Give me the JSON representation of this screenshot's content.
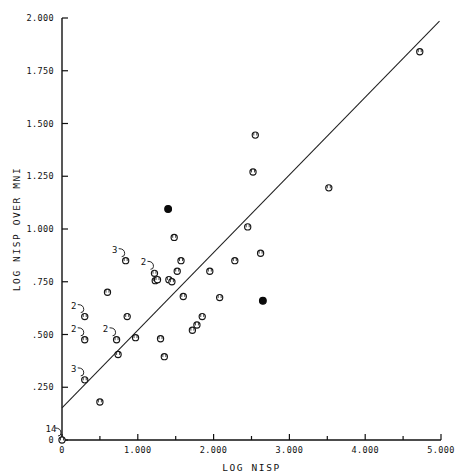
{
  "chart_data": {
    "type": "scatter",
    "title": "",
    "xlabel": "LOG NISP",
    "ylabel": "LOG NISP OVER MNI",
    "xlim": [
      0,
      5.0
    ],
    "ylim": [
      0,
      2.0
    ],
    "grid": false,
    "legend": null,
    "x_ticks": [
      0,
      0.5,
      1.0,
      1.5,
      2.0,
      2.5,
      3.0,
      3.5,
      4.0,
      4.5,
      5.0
    ],
    "x_tick_labels": [
      "0",
      "",
      "1.000",
      "",
      "2.000",
      "",
      "3.000",
      "",
      "4.000",
      "",
      "5.000"
    ],
    "y_ticks": [
      0,
      0.25,
      0.5,
      0.75,
      1.0,
      1.25,
      1.5,
      1.75,
      2.0
    ],
    "y_tick_labels": [
      "0",
      ".250",
      ".500",
      ".750",
      "1.000",
      "1.250",
      "1.500",
      "1.750",
      "2.000"
    ],
    "marker_styles": {
      "open": "open-circle",
      "filled": "filled-circle"
    },
    "points": [
      {
        "x": 0.0,
        "y": 0.0,
        "marker": "open",
        "count": 14,
        "label": "14"
      },
      {
        "x": 0.3,
        "y": 0.285,
        "marker": "open",
        "count": 3,
        "label": "3"
      },
      {
        "x": 0.3,
        "y": 0.475,
        "marker": "open",
        "count": 2,
        "label": "2"
      },
      {
        "x": 0.3,
        "y": 0.585,
        "marker": "open",
        "count": 2,
        "label": "2"
      },
      {
        "x": 0.5,
        "y": 0.18,
        "marker": "open",
        "count": 1,
        "label": ""
      },
      {
        "x": 0.6,
        "y": 0.7,
        "marker": "open",
        "count": 1,
        "label": ""
      },
      {
        "x": 0.72,
        "y": 0.475,
        "marker": "open",
        "count": 2,
        "label": "2"
      },
      {
        "x": 0.74,
        "y": 0.405,
        "marker": "open",
        "count": 1,
        "label": ""
      },
      {
        "x": 0.84,
        "y": 0.85,
        "marker": "open",
        "count": 3,
        "label": "3"
      },
      {
        "x": 0.86,
        "y": 0.585,
        "marker": "open",
        "count": 1,
        "label": ""
      },
      {
        "x": 0.97,
        "y": 0.485,
        "marker": "open",
        "count": 1,
        "label": ""
      },
      {
        "x": 1.22,
        "y": 0.79,
        "marker": "open",
        "count": 2,
        "label": "2"
      },
      {
        "x": 1.23,
        "y": 0.755,
        "marker": "open",
        "count": 1,
        "label": ""
      },
      {
        "x": 1.26,
        "y": 0.76,
        "marker": "open",
        "count": 1,
        "label": ""
      },
      {
        "x": 1.3,
        "y": 0.48,
        "marker": "open",
        "count": 1,
        "label": ""
      },
      {
        "x": 1.35,
        "y": 0.395,
        "marker": "open",
        "count": 1,
        "label": ""
      },
      {
        "x": 1.4,
        "y": 1.095,
        "marker": "filled",
        "count": 1,
        "label": ""
      },
      {
        "x": 1.41,
        "y": 0.76,
        "marker": "open",
        "count": 1,
        "label": ""
      },
      {
        "x": 1.45,
        "y": 0.75,
        "marker": "open",
        "count": 1,
        "label": ""
      },
      {
        "x": 1.48,
        "y": 0.96,
        "marker": "open",
        "count": 1,
        "label": ""
      },
      {
        "x": 1.52,
        "y": 0.8,
        "marker": "open",
        "count": 1,
        "label": ""
      },
      {
        "x": 1.57,
        "y": 0.85,
        "marker": "open",
        "count": 1,
        "label": ""
      },
      {
        "x": 1.6,
        "y": 0.68,
        "marker": "open",
        "count": 1,
        "label": ""
      },
      {
        "x": 1.72,
        "y": 0.52,
        "marker": "open",
        "count": 1,
        "label": ""
      },
      {
        "x": 1.78,
        "y": 0.545,
        "marker": "open",
        "count": 1,
        "label": ""
      },
      {
        "x": 1.85,
        "y": 0.585,
        "marker": "open",
        "count": 1,
        "label": ""
      },
      {
        "x": 1.95,
        "y": 0.8,
        "marker": "open",
        "count": 1,
        "label": ""
      },
      {
        "x": 2.08,
        "y": 0.675,
        "marker": "open",
        "count": 1,
        "label": ""
      },
      {
        "x": 2.28,
        "y": 0.85,
        "marker": "open",
        "count": 1,
        "label": ""
      },
      {
        "x": 2.45,
        "y": 1.01,
        "marker": "open",
        "count": 1,
        "label": ""
      },
      {
        "x": 2.52,
        "y": 1.27,
        "marker": "open",
        "count": 1,
        "label": ""
      },
      {
        "x": 2.55,
        "y": 1.445,
        "marker": "open",
        "count": 1,
        "label": ""
      },
      {
        "x": 2.62,
        "y": 0.885,
        "marker": "open",
        "count": 1,
        "label": ""
      },
      {
        "x": 2.65,
        "y": 0.66,
        "marker": "filled",
        "count": 1,
        "label": ""
      },
      {
        "x": 3.52,
        "y": 1.195,
        "marker": "open",
        "count": 1,
        "label": ""
      },
      {
        "x": 4.72,
        "y": 1.84,
        "marker": "open",
        "count": 1,
        "label": ""
      }
    ],
    "fit_line": {
      "x_start": 0.0,
      "y_start": 0.152,
      "x_end": 4.98,
      "y_end": 1.985,
      "style": "solid"
    }
  }
}
